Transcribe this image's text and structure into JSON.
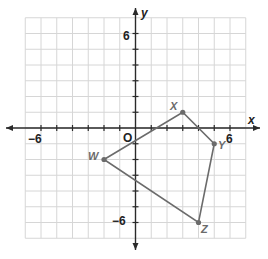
{
  "diagram": {
    "type": "coordinate-plane-polygon",
    "axes": {
      "x_label": "x",
      "y_label": "y",
      "origin_label": "O",
      "x_range": [
        -7,
        7
      ],
      "y_range": [
        -7,
        7
      ],
      "tick_labels": {
        "x_neg": "−6",
        "x_pos": "6",
        "y_pos": "6",
        "y_neg": "−6"
      }
    },
    "polygon": {
      "name": "WXYZ",
      "vertices": [
        {
          "label": "W",
          "x": -2,
          "y": -2
        },
        {
          "label": "X",
          "x": 3,
          "y": 1
        },
        {
          "label": "Y",
          "x": 5,
          "y": -1
        },
        {
          "label": "Z",
          "x": 4,
          "y": -6
        }
      ],
      "color": "#6b6b6b"
    },
    "colors": {
      "grid": "#d6d6d6",
      "axis": "#2a2a2a",
      "background": "#ffffff"
    }
  }
}
